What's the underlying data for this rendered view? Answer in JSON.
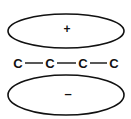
{
  "diagram": {
    "top_lobe": {
      "sign": "+"
    },
    "bottom_lobe": {
      "sign": "–"
    },
    "chain": {
      "atoms": [
        "C",
        "C",
        "C",
        "C"
      ],
      "bond": "—"
    },
    "colors": {
      "stroke": "#111111",
      "background": "#ffffff"
    }
  }
}
